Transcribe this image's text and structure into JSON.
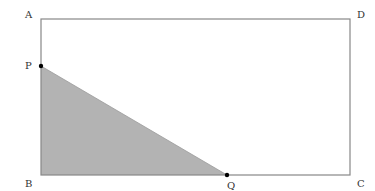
{
  "diagram": {
    "type": "geometry-rectangle-with-shaded-triangle",
    "colors": {
      "stroke": "#888888",
      "fill": "#b3b3b3",
      "point": "#000000",
      "label": "#333333"
    },
    "vertices": {
      "A": {
        "label": "A",
        "x": 41,
        "y": 19
      },
      "D": {
        "label": "D",
        "x": 350,
        "y": 19
      },
      "C": {
        "label": "C",
        "x": 350,
        "y": 175
      },
      "B": {
        "label": "B",
        "x": 41,
        "y": 175
      }
    },
    "points": {
      "P": {
        "label": "P",
        "x": 41,
        "y": 66,
        "on_side": "AB"
      },
      "Q": {
        "label": "Q",
        "x": 227,
        "y": 175,
        "on_side": "BC"
      }
    },
    "shaded_region": [
      "P",
      "B",
      "Q"
    ]
  }
}
